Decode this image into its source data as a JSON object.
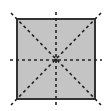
{
  "diagram": {
    "shape": {
      "type": "square",
      "x": 17,
      "y": 19,
      "width": 78,
      "height": 80,
      "fill": "#c4c4c4",
      "stroke": "#333333",
      "stroke_width": 2
    },
    "symmetry_lines": {
      "count": 4,
      "color": "#222222",
      "dash": "3,3",
      "width": 1.6,
      "lines": [
        {
          "name": "diagonal-top-left-to-bottom-right",
          "x1": 11,
          "y1": 13,
          "x2": 101,
          "y2": 105
        },
        {
          "name": "diagonal-top-right-to-bottom-left",
          "x1": 101,
          "y1": 13,
          "x2": 11,
          "y2": 105
        },
        {
          "name": "vertical-midline",
          "x1": 56,
          "y1": 12,
          "x2": 56,
          "y2": 106
        },
        {
          "name": "horizontal-midline",
          "x1": 10,
          "y1": 60,
          "x2": 102,
          "y2": 60
        }
      ]
    },
    "center": {
      "x": 56,
      "y": 60
    }
  }
}
